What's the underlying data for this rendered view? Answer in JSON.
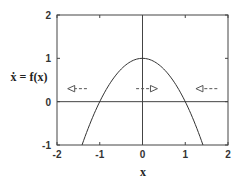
{
  "chart_data": {
    "type": "line",
    "title": "",
    "xlabel": "x",
    "ylabel": "ẋ = f(x)",
    "xlim": [
      -2,
      2
    ],
    "ylim": [
      -1,
      2
    ],
    "xticks": [
      -2,
      -1,
      0,
      1,
      2
    ],
    "yticks": [
      -1,
      0,
      1,
      2
    ],
    "grid": false,
    "legend": null,
    "series": [
      {
        "name": "f(x) = 1 - x^2",
        "x": [
          -1.414,
          -1.2,
          -1.0,
          -0.8,
          -0.6,
          -0.4,
          -0.2,
          0.0,
          0.2,
          0.4,
          0.6,
          0.8,
          1.0,
          1.2,
          1.414
        ],
        "y": [
          -1.0,
          -0.44,
          0.0,
          0.36,
          0.64,
          0.84,
          0.96,
          1.0,
          0.96,
          0.84,
          0.64,
          0.36,
          0.0,
          -0.44,
          -1.0
        ]
      }
    ],
    "reference_lines": {
      "horizontal": [
        0
      ],
      "vertical": [
        0
      ]
    },
    "annotations": [
      {
        "type": "flow-arrow",
        "direction": "left",
        "x_from": -1.3,
        "x_to": -1.75,
        "y": 0.3
      },
      {
        "type": "flow-arrow",
        "direction": "right",
        "x_from": -0.15,
        "x_to": 0.35,
        "y": 0.3
      },
      {
        "type": "flow-arrow",
        "direction": "left",
        "x_from": 1.75,
        "x_to": 1.25,
        "y": 0.3
      }
    ]
  },
  "axes": {
    "xlabel": "x",
    "ylabel": "ẋ = f(x)",
    "xtick_labels": [
      "-2",
      "-1",
      "0",
      "1",
      "2"
    ],
    "ytick_labels": [
      "-1",
      "0",
      "1",
      "2"
    ]
  },
  "style": {
    "line_color": "#333333",
    "frame_color": "#444444",
    "arrow_color": "#555555"
  }
}
